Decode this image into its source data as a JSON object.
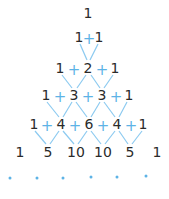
{
  "rows": [
    [
      "1"
    ],
    [
      "1",
      "1"
    ],
    [
      "1",
      "2",
      "1"
    ],
    [
      "1",
      "3",
      "3",
      "1"
    ],
    [
      "1",
      "4",
      "6",
      "4",
      "1"
    ],
    [
      "1",
      "5",
      "10",
      "10",
      "5",
      "1"
    ]
  ],
  "operator": "+",
  "continuation": "• • • • • •",
  "colors": {
    "numbers": "#2b2b2b",
    "accent": "#5db3e6"
  }
}
